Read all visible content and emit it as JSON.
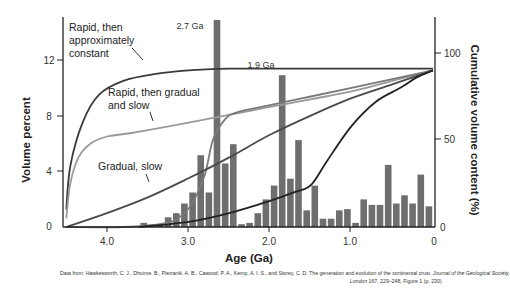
{
  "chart_data": {
    "type": "bar+line",
    "title": "",
    "xlabel": "Age (Ga)",
    "ylabel": "Volume percent",
    "ylabel_right": "Cumulative volume content (%)",
    "xlim": [
      4.55,
      0
    ],
    "ylim": [
      0,
      15
    ],
    "ylim_right": [
      0,
      100
    ],
    "x_ticks": [
      "4.0",
      "3.0",
      "2.0",
      "1.0",
      "0"
    ],
    "y_ticks": [
      "0",
      "4",
      "8",
      "12"
    ],
    "y_ticks_right": [
      "0",
      "50",
      "100"
    ],
    "grid": false,
    "peak_labels": [
      "2.7 Ga",
      "1.9 Ga"
    ],
    "histogram": {
      "bin_width_ga": 0.1,
      "ages": [
        3.6,
        3.5,
        3.4,
        3.3,
        3.2,
        3.1,
        3.0,
        2.9,
        2.8,
        2.7,
        2.6,
        2.5,
        2.4,
        2.3,
        2.2,
        2.1,
        2.0,
        1.9,
        1.8,
        1.7,
        1.6,
        1.5,
        1.4,
        1.3,
        1.2,
        1.1,
        1.0,
        0.9,
        0.8,
        0.7,
        0.6,
        0.5,
        0.4,
        0.3,
        0.2,
        0.1
      ],
      "values": [
        0.3,
        0.1,
        0.2,
        0.7,
        1.0,
        1.7,
        2.5,
        5.2,
        2.5,
        15.0,
        4.6,
        6.0,
        0.2,
        0.3,
        1.0,
        2.0,
        3.0,
        11.0,
        3.5,
        6.3,
        1.2,
        3.0,
        0.6,
        0.6,
        1.2,
        1.3,
        0.3,
        2.0,
        1.6,
        1.6,
        4.5,
        1.7,
        2.3,
        1.7,
        3.8,
        1.5
      ]
    },
    "series": [
      {
        "name": "Rapid, then approximately constant",
        "color": "#3a3a3a",
        "x": [
          4.5,
          4.45,
          4.3,
          4.1,
          3.8,
          3.4,
          3.0,
          2.5,
          2.0,
          1.5,
          1.0,
          0.5,
          0
        ],
        "y": [
          10,
          35,
          60,
          76,
          84,
          88,
          90,
          91,
          91,
          91,
          91,
          91,
          91
        ]
      },
      {
        "name": "Rapid, then gradual and slow",
        "color": "#9a9a9a",
        "x": [
          4.5,
          4.45,
          4.35,
          4.2,
          4.0,
          3.7,
          3.0,
          2.0,
          1.0,
          0.5,
          0
        ],
        "y": [
          5,
          25,
          40,
          48,
          52,
          54,
          60,
          69,
          78,
          84,
          90
        ]
      },
      {
        "name": "Stepped growth (2.7 Ga, 1.9 Ga)",
        "color": "#7a7a7a",
        "x": [
          4.5,
          3.8,
          3.3,
          3.1,
          2.95,
          2.8,
          2.7,
          2.55,
          2.4,
          2.0,
          1.5,
          1.0,
          0.5,
          0
        ],
        "y": [
          0,
          0,
          2,
          6,
          14,
          30,
          50,
          62,
          66,
          70,
          75,
          80,
          85,
          90
        ]
      },
      {
        "name": "Gradual, slow",
        "color": "#4a4a4a",
        "x": [
          4.5,
          4.0,
          3.5,
          3.0,
          2.5,
          2.0,
          1.5,
          1.0,
          0.5,
          0
        ],
        "y": [
          0,
          8,
          17,
          28,
          40,
          53,
          64,
          74,
          82,
          90
        ]
      },
      {
        "name": "Late growth",
        "color": "#222222",
        "x": [
          3.6,
          3.0,
          2.5,
          2.0,
          1.7,
          1.5,
          1.3,
          1.0,
          0.7,
          0.4,
          0.2,
          0
        ],
        "y": [
          0,
          3,
          8,
          15,
          20,
          24,
          38,
          58,
          72,
          80,
          86,
          90
        ]
      }
    ],
    "annotations": [
      {
        "text": "Rapid, then",
        "line": 1
      },
      {
        "text": "approximately",
        "line": 2
      },
      {
        "text": "constant",
        "line": 3
      },
      {
        "text": "Rapid, then gradual",
        "line": 1
      },
      {
        "text": "and slow",
        "line": 2
      },
      {
        "text": "Gradual, slow",
        "line": 1
      }
    ]
  },
  "labels": {
    "annot_rapid_const_1": "Rapid, then",
    "annot_rapid_const_2": "approximately",
    "annot_rapid_const_3": "constant",
    "annot_rapid_grad_1": "Rapid, then gradual",
    "annot_rapid_grad_2": "and slow",
    "annot_gradual": "Gradual, slow",
    "peak_27": "2.7 Ga",
    "peak_19": "1.9 Ga",
    "xlabel": "Age (Ga)",
    "ylabel": "Volume percent",
    "ylabel_right": "Cumulative volume content (%)",
    "xt_40": "4.0",
    "xt_30": "3.0",
    "xt_20": "2.0",
    "xt_10": "1.0",
    "xt_0": "0",
    "yt_0": "0",
    "yt_4": "4",
    "yt_8": "8",
    "yt_12": "12",
    "yr_0": "0",
    "yr_50": "50",
    "yr_100": "100"
  },
  "caption": {
    "line1_a": "Data from: Hawkesworth, C. J., Dhuime, B., Pietranik, A. B., Cawood, P. A., Kemp, A. I. S., and Storey, C. D. The generation and evolution of the continental crust. ",
    "line1_journal": "Journal of the Geological Society,",
    "line2_journal": "London",
    "line2_b": " 167, 229–248, Figure 1 (p. 230)."
  },
  "colors": {
    "bars": "#6e6e6e",
    "axis": "#222222"
  }
}
